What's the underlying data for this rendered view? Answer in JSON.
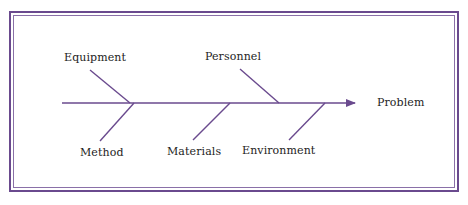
{
  "diagram": {
    "type": "fishbone",
    "effect": {
      "label": "Problem"
    },
    "causes": [
      {
        "label": "Equipment",
        "side": "top"
      },
      {
        "label": "Personnel",
        "side": "top"
      },
      {
        "label": "Method",
        "side": "bottom"
      },
      {
        "label": "Materials",
        "side": "bottom"
      },
      {
        "label": "Environment",
        "side": "bottom"
      }
    ],
    "colors": {
      "line": "#6a4a8e",
      "frame": "#6a4a8e",
      "text": "#1d1d1d"
    }
  }
}
